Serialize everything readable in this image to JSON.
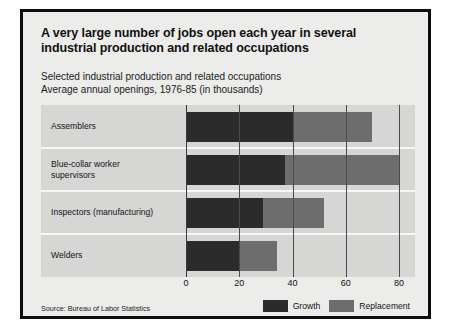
{
  "poster": {
    "title": "A very large number of jobs open each year in several industrial production and related occupations",
    "subtitle_line1": "Selected industrial production and related occupations",
    "subtitle_line2": "Average annual openings, 1976-85 (in thousands)",
    "source": "Source: Bureau of Labor Statistics"
  },
  "chart_data": {
    "type": "bar",
    "orientation": "horizontal",
    "stacked": true,
    "title": "A very large number of jobs open each year in several industrial production and related occupations",
    "subtitle": "Selected industrial production and related occupations. Average annual openings, 1976-85 (in thousands)",
    "xlabel": "",
    "ylabel": "",
    "xlim": [
      0,
      80
    ],
    "xticks": [
      0,
      20,
      40,
      60,
      80
    ],
    "xtick_labels": [
      "0",
      "20",
      "40",
      "60",
      "80"
    ],
    "grid": true,
    "legend_position": "bottom-right",
    "units": "thousands",
    "categories": [
      "Assemblers",
      "Blue-collar worker supervisors",
      "Inspectors (manufacturing)",
      "Welders"
    ],
    "series": [
      {
        "name": "Growth",
        "color": "#2b2b2b",
        "values": [
          40,
          37,
          29,
          20
        ]
      },
      {
        "name": "Replacement",
        "color": "#6d6d6d",
        "values": [
          30,
          43,
          23,
          14
        ]
      }
    ],
    "totals": [
      70,
      80,
      52,
      34
    ]
  },
  "legend": [
    {
      "label": "Growth",
      "color": "#2b2b2b"
    },
    {
      "label": "Replacement",
      "color": "#6d6d6d"
    }
  ],
  "colors": {
    "growth": "#2b2b2b",
    "replacement": "#6d6d6d",
    "plot_background": "#d6d6d4",
    "poster_background": "#ececea",
    "frame": "#0d0d0d"
  }
}
